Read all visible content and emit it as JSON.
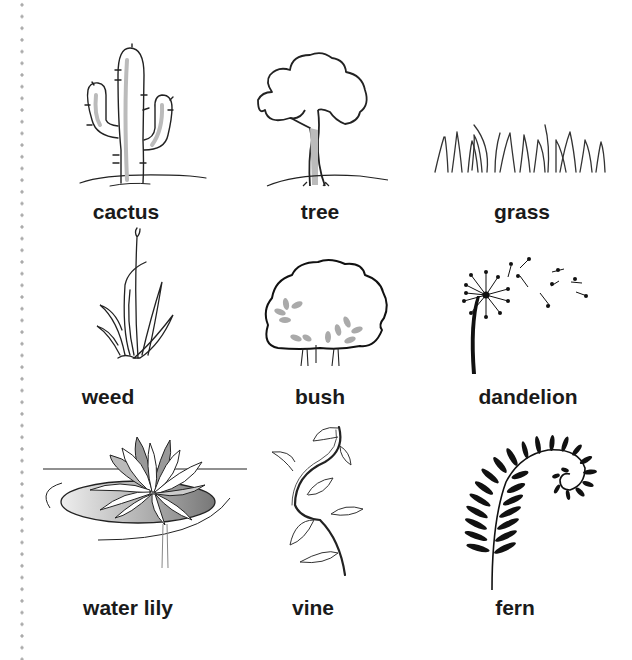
{
  "page": {
    "margin": "dotted-left-margin"
  },
  "plants": [
    {
      "id": "cactus",
      "label": "cactus",
      "icon": "cactus-illustration"
    },
    {
      "id": "tree",
      "label": "tree",
      "icon": "tree-illustration"
    },
    {
      "id": "grass",
      "label": "grass",
      "icon": "grass-illustration"
    },
    {
      "id": "weed",
      "label": "weed",
      "icon": "weed-illustration"
    },
    {
      "id": "bush",
      "label": "bush",
      "icon": "bush-illustration"
    },
    {
      "id": "dandelion",
      "label": "dandelion",
      "icon": "dandelion-illustration"
    },
    {
      "id": "water-lily",
      "label": "water lily",
      "icon": "water-lily-illustration"
    },
    {
      "id": "vine",
      "label": "vine",
      "icon": "vine-illustration"
    },
    {
      "id": "fern",
      "label": "fern",
      "icon": "fern-illustration"
    }
  ],
  "colors": {
    "ink": "#1a1a1a",
    "shade": "#b5b5b5",
    "dots": "#aaaaaa"
  }
}
